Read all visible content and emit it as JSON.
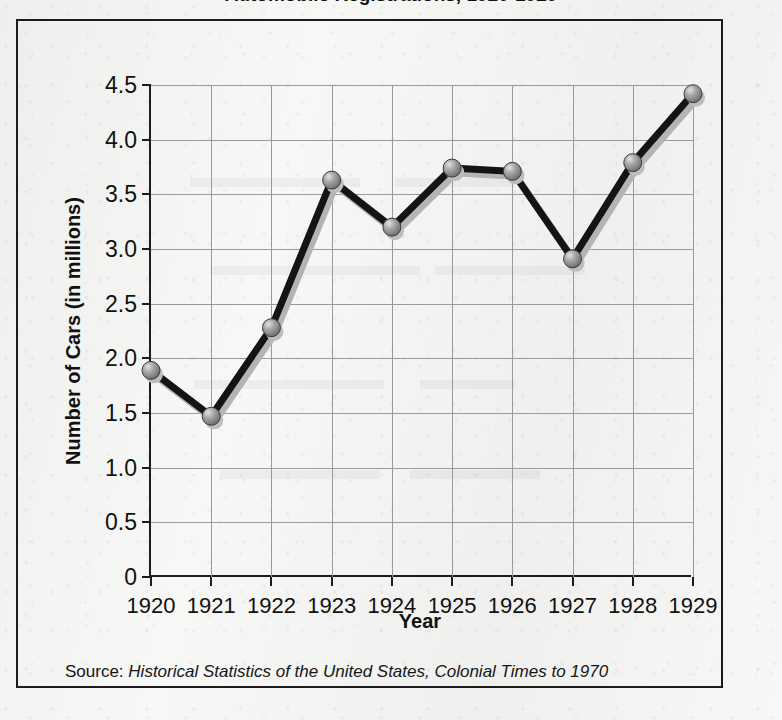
{
  "title": "Automobile Registrations, 1920-1929",
  "source_note": {
    "prefix": "Source:",
    "reference": "Historical Statistics of the United States, Colonial Times to 1970"
  },
  "colors": {
    "line": "#141414",
    "marker_fill": "#8d8d8d",
    "marker_highlight": "#d8d8d8",
    "marker_edge": "#3a3a3a",
    "gridline": "#9a9a9a",
    "axis": "#1c1c1c",
    "paper": "#f7f7f5",
    "text": "#111111"
  },
  "chart_data": {
    "type": "line",
    "title": "Automobile Registrations, 1920-1929",
    "xlabel": "Year",
    "ylabel": "Number of Cars (in millions)",
    "categories": [
      "1920",
      "1921",
      "1922",
      "1923",
      "1924",
      "1925",
      "1926",
      "1927",
      "1928",
      "1929"
    ],
    "values": [
      1.89,
      1.47,
      2.28,
      3.63,
      3.2,
      3.74,
      3.71,
      2.91,
      3.79,
      4.42
    ],
    "series": [
      {
        "name": "Number of Cars (in millions)",
        "values": [
          1.89,
          1.47,
          2.28,
          3.63,
          3.2,
          3.74,
          3.71,
          2.91,
          3.79,
          4.42
        ]
      }
    ],
    "ylim": [
      0,
      4.5
    ],
    "yticks": [
      "0",
      "0.5",
      "1.0",
      "1.5",
      "2.0",
      "2.5",
      "3.0",
      "3.5",
      "4.0",
      "4.5"
    ],
    "ytick_values": [
      0,
      0.5,
      1.0,
      1.5,
      2.0,
      2.5,
      3.0,
      3.5,
      4.0,
      4.5
    ],
    "xticks": [
      "1920",
      "1921",
      "1922",
      "1923",
      "1924",
      "1925",
      "1926",
      "1927",
      "1928",
      "1929"
    ],
    "grid": true,
    "legend": "none",
    "marker": "sphere"
  }
}
